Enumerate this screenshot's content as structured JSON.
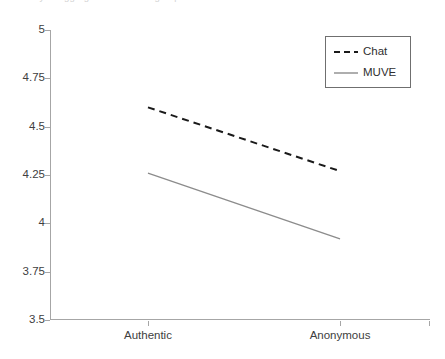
{
  "figure": {
    "caption_remnant": "ay of aggregate the across groups",
    "background": "#ffffff",
    "axis_color": "#a6a6a6",
    "text_color": "#404040"
  },
  "legend": {
    "position": "top-right",
    "border_color": "#6f6f6f",
    "entries": [
      {
        "label": "Chat",
        "color": "#1a1a1a",
        "style": "dashed",
        "icon": "dashed-line-swatch"
      },
      {
        "label": "MUVE",
        "color": "#8c8c8c",
        "style": "solid",
        "icon": "solid-line-swatch"
      }
    ]
  },
  "chart_data": {
    "type": "line",
    "title": "",
    "subtitle": "",
    "xlabel": "",
    "ylabel": "",
    "categories": [
      "Authentic",
      "Anonymous"
    ],
    "x": [
      0,
      1
    ],
    "ylim": [
      3.5,
      5
    ],
    "yticks": [
      5,
      4.75,
      4.5,
      4.25,
      4,
      3.75,
      3.5
    ],
    "ytick_labels": [
      "5",
      "4.75",
      "4.5",
      "4.25",
      "4",
      "3.75",
      "3.5"
    ],
    "xtick_labels": [
      "Authentic",
      "Anonymous"
    ],
    "grid": false,
    "legend_position": "top-right",
    "series": [
      {
        "name": "Chat",
        "values": [
          4.6,
          4.27
        ],
        "color": "#1a1a1a",
        "style": "dashed",
        "width": 2
      },
      {
        "name": "MUVE",
        "values": [
          4.26,
          3.92
        ],
        "color": "#8c8c8c",
        "style": "solid",
        "width": 1.4
      }
    ]
  }
}
